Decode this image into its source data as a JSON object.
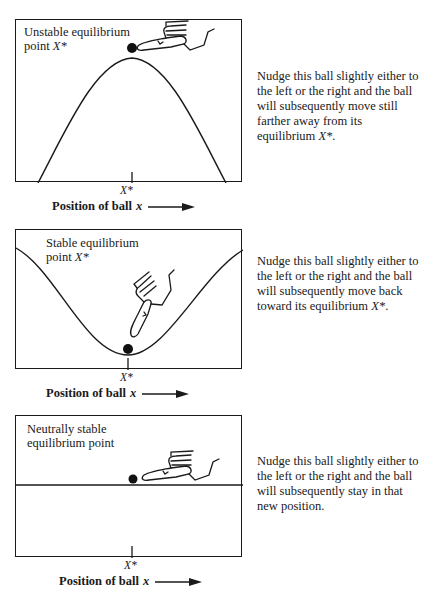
{
  "header_fragment": "Stability of equilibrium points",
  "panels": [
    {
      "id": "unstable",
      "title_line1": "Unstable equilibrium",
      "title_line2_prefix": "point ",
      "title_line2_var": "X*",
      "tick_label": "X*",
      "axis_label": "Position of ball",
      "axis_var": "x",
      "description": "Nudge this ball slightly either to the left or the right and the ball will subsequently move still farther away from its equilibrium ",
      "description_var": "X*",
      "description_end": ".",
      "curve": "hill"
    },
    {
      "id": "stable",
      "title_line1": "Stable equilibrium",
      "title_line2_prefix": "point ",
      "title_line2_var": "X*",
      "tick_label": "X*",
      "axis_label": "Position of ball",
      "axis_var": "x",
      "description": "Nudge this ball slightly either to the left or the right and the ball will subsequently move back toward its equilibrium ",
      "description_var": "X*",
      "description_end": ".",
      "curve": "valley"
    },
    {
      "id": "neutral",
      "title_line1": "Neutrally stable",
      "title_line2_prefix": "equilibrium point",
      "title_line2_var": "",
      "tick_label": "X*",
      "axis_label": "Position of ball",
      "axis_var": "x",
      "description": "Nudge this ball slightly either to the left or the right and the ball will subsequently stay in that new position.",
      "description_var": "",
      "description_end": "",
      "curve": "flat"
    }
  ],
  "colors": {
    "ink": "#1a1a1a",
    "background": "#ffffff"
  }
}
